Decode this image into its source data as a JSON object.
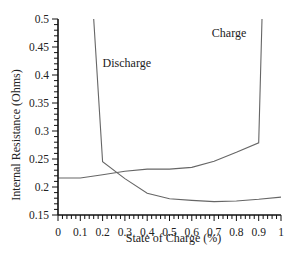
{
  "chart_data": {
    "type": "line",
    "title": "",
    "xlabel": "State of Charge (%)",
    "ylabel": "Internal Resistance (Ohms)",
    "xlim": [
      0,
      1
    ],
    "ylim": [
      0.15,
      0.5
    ],
    "grid": false,
    "legend": "none (inline annotations)",
    "x_ticks": [
      "0",
      "0.1",
      "0.2",
      "0.3",
      "0.4",
      "0.5",
      "0.6",
      "0.7",
      "0.8",
      "0.9",
      "1"
    ],
    "y_ticks": [
      "0.15",
      "0.2",
      "0.25",
      "0.3",
      "0.35",
      "0.4",
      "0.45",
      "0.5"
    ],
    "annotations": [
      {
        "text": "Charge",
        "x": 0.69,
        "y": 0.468
      },
      {
        "text": "Discharge",
        "x": 0.2,
        "y": 0.415
      }
    ],
    "series": [
      {
        "name": "Discharge",
        "x": [
          0.16,
          0.2,
          0.3,
          0.4,
          0.5,
          0.6,
          0.7,
          0.8,
          0.9,
          1.0
        ],
        "y": [
          0.5,
          0.245,
          0.215,
          0.189,
          0.179,
          0.176,
          0.174,
          0.175,
          0.178,
          0.182
        ]
      },
      {
        "name": "Charge",
        "x": [
          0.0,
          0.1,
          0.2,
          0.3,
          0.4,
          0.5,
          0.6,
          0.7,
          0.8,
          0.9,
          0.915
        ],
        "y": [
          0.216,
          0.216,
          0.222,
          0.228,
          0.232,
          0.232,
          0.235,
          0.246,
          0.262,
          0.279,
          0.5
        ]
      }
    ]
  },
  "plot": {
    "left": 58,
    "right": 281,
    "top": 19,
    "bottom": 215,
    "line_color": "#666666",
    "axis_color": "#111111"
  }
}
